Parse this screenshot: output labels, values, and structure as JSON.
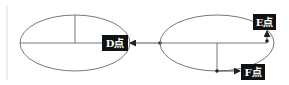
{
  "diagram": {
    "labels": {
      "d": "D点",
      "e": "E点",
      "f": "F点"
    },
    "colors": {
      "label_bg": "#111111",
      "label_text": "#ffffff",
      "stroke": "#777777",
      "border_left": "#cccccc"
    }
  }
}
